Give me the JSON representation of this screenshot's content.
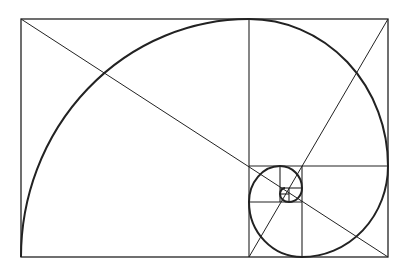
{
  "diagram": {
    "background": "#ffffff",
    "stroke_color": "#222222",
    "outer_rect": {
      "x": 21,
      "y": 19,
      "w": 367,
      "h": 238
    },
    "lines": [
      {
        "x1": 249,
        "y1": 19,
        "x2": 249,
        "y2": 257
      },
      {
        "x1": 249,
        "y1": 166,
        "x2": 388,
        "y2": 166
      },
      {
        "x1": 302,
        "y1": 166,
        "x2": 302,
        "y2": 257
      },
      {
        "x1": 249,
        "y1": 202,
        "x2": 302,
        "y2": 202
      },
      {
        "x1": 280,
        "y1": 166,
        "x2": 280,
        "y2": 202
      },
      {
        "x1": 280,
        "y1": 188,
        "x2": 302,
        "y2": 188
      },
      {
        "x1": 289,
        "y1": 188,
        "x2": 289,
        "y2": 202
      },
      {
        "x1": 280,
        "y1": 194,
        "x2": 289,
        "y2": 194
      }
    ],
    "diagonals": [
      {
        "x1": 21,
        "y1": 19,
        "x2": 388,
        "y2": 257
      },
      {
        "x1": 388,
        "y1": 19,
        "x2": 249,
        "y2": 257
      }
    ],
    "spiral_path": "M21,257 A228,238 0 0 1 249,19 A139,147 0 0 1 388,166 A86,91 0 0 1 302,257 A53,55 0 0 1 249,202 A31,36 0 0 1 280,166 A22,22 0 0 1 302,188 A13,14 0 0 1 289,202 A9,8 0 0 1 280,194 A5,6 0 0 1 285,188"
  }
}
